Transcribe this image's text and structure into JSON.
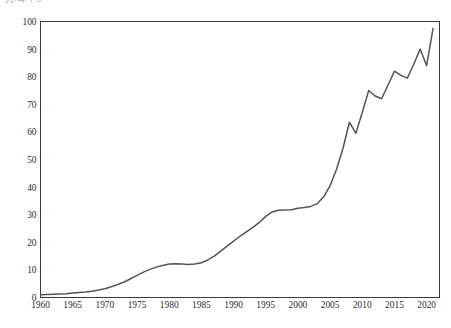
{
  "clipped_caption": "刀/斗·l·6",
  "chart_data": {
    "type": "line",
    "title": "",
    "subtitle": "",
    "xlabel": "",
    "ylabel": "",
    "xlim": [
      1960,
      2022
    ],
    "ylim": [
      0,
      100
    ],
    "grid": false,
    "legend": "none",
    "line_color": "#555555",
    "frame_color": "#3a3a3a",
    "xtick_labels": [
      "1960",
      "1965",
      "1970",
      "1975",
      "1980",
      "1985",
      "1990",
      "1995",
      "2000",
      "2005",
      "2010",
      "2015",
      "2020"
    ],
    "xticks": [
      1960,
      1965,
      1970,
      1975,
      1980,
      1985,
      1990,
      1995,
      2000,
      2005,
      2010,
      2015,
      2020
    ],
    "ytick_labels": [
      "0",
      "10",
      "20",
      "30",
      "40",
      "50",
      "60",
      "70",
      "80",
      "90",
      "100"
    ],
    "yticks": [
      0,
      10,
      20,
      30,
      40,
      50,
      60,
      70,
      80,
      90,
      100
    ],
    "series": [
      {
        "name": "series-1",
        "x": [
          1960,
          1961,
          1962,
          1963,
          1964,
          1965,
          1966,
          1967,
          1968,
          1969,
          1970,
          1971,
          1972,
          1973,
          1974,
          1975,
          1976,
          1977,
          1978,
          1979,
          1980,
          1981,
          1982,
          1983,
          1984,
          1985,
          1986,
          1987,
          1988,
          1989,
          1990,
          1991,
          1992,
          1993,
          1994,
          1995,
          1996,
          1997,
          1998,
          1999,
          2000,
          2001,
          2002,
          2003,
          2004,
          2005,
          2006,
          2007,
          2008,
          2009,
          2010,
          2011,
          2012,
          2013,
          2014,
          2015,
          2016,
          2017,
          2018,
          2019,
          2020,
          2021
        ],
        "values": [
          1.0,
          1.1,
          1.2,
          1.3,
          1.4,
          1.6,
          1.8,
          2.0,
          2.3,
          2.7,
          3.2,
          3.9,
          4.7,
          5.6,
          6.8,
          8.0,
          9.2,
          10.2,
          11.0,
          11.6,
          12.1,
          12.2,
          12.1,
          12.0,
          12.1,
          12.6,
          13.6,
          15.0,
          16.8,
          18.6,
          20.4,
          22.2,
          23.8,
          25.4,
          27.2,
          29.4,
          31.0,
          31.6,
          31.7,
          31.8,
          32.3,
          32.6,
          33.0,
          34.0,
          36.5,
          40.5,
          46.5,
          54.0,
          63.5,
          59.5,
          67.0,
          75.0,
          73.0,
          72.0,
          77.0,
          82.0,
          80.5,
          79.5,
          84.5,
          90.0,
          84.0,
          97.5
        ]
      }
    ]
  }
}
